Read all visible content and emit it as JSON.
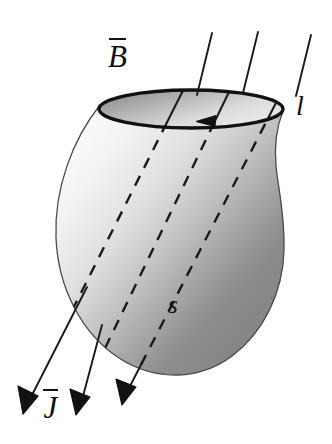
{
  "figure": {
    "name": "magnetic-flux-through-open-surface",
    "background_color": "#ffffff",
    "width": 332,
    "height": 444,
    "ink_color": "#111111"
  },
  "labels": {
    "field": {
      "symbol": "B",
      "overbar": true,
      "text": "B̄"
    },
    "current": {
      "symbol": "J",
      "overbar": true,
      "text": "J̄"
    },
    "loop": {
      "symbol": "l",
      "overbar": false,
      "text": "l"
    },
    "surface": {
      "symbol": "s",
      "overbar": false,
      "text": "s"
    }
  },
  "surface": {
    "name": "open-surface-s",
    "fill_light": "#f7f7f7",
    "fill_mid": "#c9c9c9",
    "fill_dark": "#8c8c8c",
    "outline_color": "#2b2b2b",
    "outline_width": 1.4
  },
  "boundary_loop": {
    "name": "boundary-curve-l",
    "shape": "ellipse",
    "center_x": 191,
    "center_y": 109,
    "radius_x": 92,
    "radius_y": 19,
    "stroke_color": "#111111",
    "stroke_width": 3.2,
    "fill_light": "#e8e8e8",
    "fill_dark": "#9a9a9a",
    "direction_arrow": "counterclockwise-viewed-from-above",
    "arrow_tip_x": 200,
    "arrow_tip_y": 120
  },
  "field_lines": [
    {
      "name": "field-line-1",
      "start_x": 212,
      "start_y": 33,
      "end_x": 28,
      "end_y": 398,
      "enters_surface_y": 104,
      "exits_surface_y": 288,
      "arrowhead_x": 25,
      "arrowhead_y": 401
    },
    {
      "name": "field-line-2",
      "start_x": 258,
      "start_y": 32,
      "end_x": 80,
      "end_y": 400,
      "enters_surface_y": 108,
      "exits_surface_y": 330,
      "arrowhead_x": 78,
      "arrowhead_y": 403
    },
    {
      "name": "field-line-3",
      "start_x": 311,
      "start_y": 35,
      "end_x": 128,
      "end_y": 390,
      "enters_surface_y": 110,
      "exits_surface_y": 358,
      "arrowhead_x": 125,
      "arrowhead_y": 392
    }
  ],
  "line_style": {
    "solid_stroke": "#1a1a1a",
    "solid_width": 1.9,
    "dashed_stroke": "#1a1a1a",
    "dashed_width": 2.3,
    "dash_pattern": "11 9"
  }
}
